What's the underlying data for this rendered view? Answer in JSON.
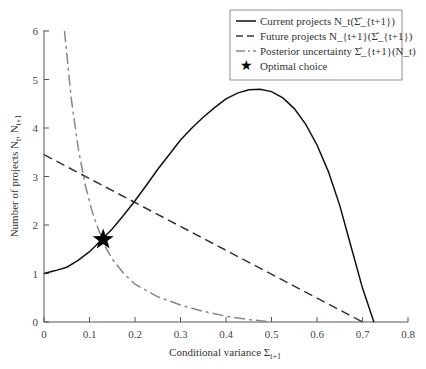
{
  "chart_data": {
    "type": "line",
    "title": "",
    "xlabel": "Conditional variance Σ_{t+1}",
    "ylabel": "Number of projects N_t, N_{t+1}",
    "xlim": [
      0,
      0.8
    ],
    "ylim": [
      0,
      6
    ],
    "x_ticks": [
      "0",
      "0.1",
      "0.2",
      "0.3",
      "0.4",
      "0.5",
      "0.6",
      "0.7",
      "0.8"
    ],
    "y_ticks": [
      "0",
      "1",
      "2",
      "3",
      "4",
      "5",
      "6"
    ],
    "grid": false,
    "legend_position": "upper right",
    "series": [
      {
        "name": "Current projects N_t(Σ̂_{t+1})",
        "style": "solid",
        "color": "#111111",
        "x": [
          0.0,
          0.025,
          0.05,
          0.075,
          0.1,
          0.125,
          0.15,
          0.175,
          0.2,
          0.225,
          0.25,
          0.275,
          0.3,
          0.325,
          0.35,
          0.375,
          0.4,
          0.425,
          0.45,
          0.475,
          0.5,
          0.525,
          0.55,
          0.575,
          0.6,
          0.625,
          0.65,
          0.675,
          0.7,
          0.725
        ],
        "y": [
          1.0,
          1.06,
          1.13,
          1.27,
          1.45,
          1.68,
          1.92,
          2.2,
          2.5,
          2.82,
          3.15,
          3.45,
          3.75,
          4.0,
          4.22,
          4.42,
          4.6,
          4.72,
          4.79,
          4.8,
          4.75,
          4.62,
          4.4,
          4.08,
          3.65,
          3.1,
          2.4,
          1.55,
          0.7,
          0.0
        ]
      },
      {
        "name": "Future projects N_{t+1}(Σ̂_{t+1})",
        "style": "dashed",
        "color": "#333333",
        "x": [
          0.0,
          0.7
        ],
        "y": [
          3.45,
          0.0
        ]
      },
      {
        "name": "Posterior uncertainty Σ̂_{t+1}(N_t)",
        "style": "dash-dot",
        "color": "#888888",
        "x": [
          0.045,
          0.06,
          0.075,
          0.09,
          0.105,
          0.12,
          0.135,
          0.15,
          0.175,
          0.2,
          0.25,
          0.3,
          0.35,
          0.4,
          0.45,
          0.5
        ],
        "y": [
          6.0,
          4.6,
          3.6,
          2.85,
          2.3,
          1.9,
          1.55,
          1.3,
          1.0,
          0.78,
          0.52,
          0.35,
          0.22,
          0.12,
          0.05,
          0.0
        ]
      },
      {
        "name": "Optimal choice",
        "style": "marker-star",
        "color": "#000000",
        "x": [
          0.13
        ],
        "y": [
          1.7
        ]
      }
    ]
  },
  "legend": {
    "items": [
      {
        "label": "Current projects N_t(Σ̂_{t+1})"
      },
      {
        "label": "Future projects N_{t+1}(Σ̂_{t+1})"
      },
      {
        "label": "Posterior uncertainty Σ̂_{t+1}(N_t)"
      },
      {
        "label": "Optimal choice"
      }
    ]
  },
  "axes": {
    "xlabel": "Conditional variance Σ",
    "xlabel_sub": "t+1",
    "ylabel": "Number of projects N",
    "ylabel_sub1": "t",
    "ylabel_mid": ", N",
    "ylabel_sub2": "t+1"
  }
}
